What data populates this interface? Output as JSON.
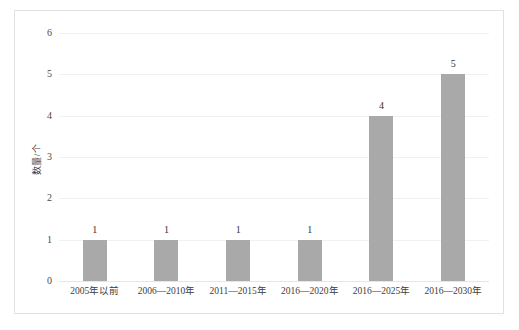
{
  "chart_data": {
    "type": "bar",
    "title": "",
    "subtitle": "",
    "xlabel": "",
    "ylabel": "数量/个",
    "categories": [
      "2005年以前",
      "2006—2010年",
      "2011—2015年",
      "2016—2020年",
      "2016—2025年",
      "2016—2030年"
    ],
    "values": [
      1,
      1,
      1,
      1,
      4,
      5
    ],
    "data_labels": [
      "1",
      "1",
      "1",
      "1",
      "4",
      "5"
    ],
    "ylim": [
      0,
      6
    ],
    "ytick_labels": [
      "0",
      "1",
      "2",
      "3",
      "4",
      "5",
      "6"
    ],
    "ytick_values": [
      0,
      1,
      2,
      3,
      4,
      5,
      6
    ],
    "grid": true,
    "grid_axis": "y",
    "legend": false,
    "legend_position": "none",
    "bar_color": "#a9a9a9",
    "gridline_color": "#f1f1f1",
    "frame_border_color": "#e2e2e2",
    "background_color": "#ffffff",
    "text_color": "#3d3d3d"
  }
}
